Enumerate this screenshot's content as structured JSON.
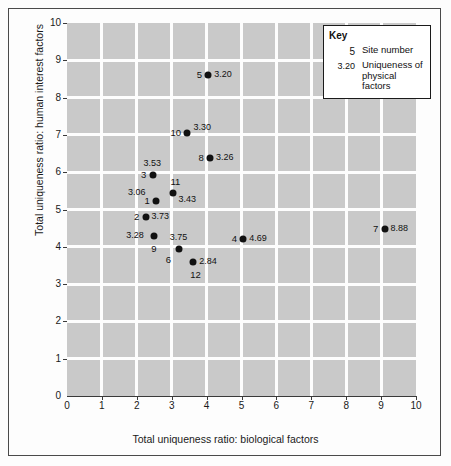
{
  "chart_data": {
    "type": "scatter",
    "title": "",
    "xlabel": "Total uniqueness ratio: biological factors",
    "ylabel": "Total uniqueness ratio: human interest factors",
    "xlim": [
      0,
      10
    ],
    "ylim": [
      0,
      10
    ],
    "xticks": [
      "0",
      "1",
      "2",
      "3",
      "4",
      "5",
      "6",
      "7",
      "8",
      "9",
      "10"
    ],
    "yticks": [
      "0",
      "1",
      "2",
      "3",
      "4",
      "5",
      "6",
      "7",
      "8",
      "9",
      "10"
    ],
    "grid": true,
    "legend_position": "top-right",
    "points": [
      {
        "site": "5",
        "x": 4.05,
        "y": 8.6,
        "value": "3.20",
        "label_side": "left",
        "value_side": "right"
      },
      {
        "site": "10",
        "x": 3.45,
        "y": 7.05,
        "value": "3.30",
        "label_side": "left",
        "value_side": "upright"
      },
      {
        "site": "8",
        "x": 4.1,
        "y": 6.38,
        "value": "3.26",
        "label_side": "left",
        "value_side": "right"
      },
      {
        "site": "3",
        "x": 2.45,
        "y": 5.92,
        "value": "3.53",
        "label_side": "left",
        "value_side": "above"
      },
      {
        "site": "11",
        "x": 3.05,
        "y": 5.45,
        "value": "3.43",
        "label_side": "above",
        "value_side": "rightlow"
      },
      {
        "site": "1",
        "x": 2.55,
        "y": 5.22,
        "value": "3.06",
        "label_side": "left",
        "value_side": "aboveleft"
      },
      {
        "site": "2",
        "x": 2.25,
        "y": 4.8,
        "value": "3.73",
        "label_side": "left",
        "value_side": "right"
      },
      {
        "site": "9",
        "x": 2.5,
        "y": 4.3,
        "value": "3.28",
        "label_side": "below",
        "value_side": "left"
      },
      {
        "site": "7",
        "x": 9.1,
        "y": 4.47,
        "value": "8.88",
        "label_side": "left",
        "value_side": "right"
      },
      {
        "site": "4",
        "x": 5.05,
        "y": 4.22,
        "value": "4.69",
        "label_side": "left",
        "value_side": "right"
      },
      {
        "site": "6",
        "x": 3.2,
        "y": 3.93,
        "value": "3.75",
        "label_side": "belowleft",
        "value_side": "above"
      },
      {
        "site": "12",
        "x": 3.62,
        "y": 3.6,
        "value": "2.84",
        "label_side": "below",
        "value_side": "right"
      }
    ]
  },
  "key": {
    "title": "Key",
    "rows": [
      {
        "symbol": "5",
        "text": "Site number"
      },
      {
        "symbol": "3.20",
        "text": "Uniqueness of physical factors"
      }
    ]
  }
}
